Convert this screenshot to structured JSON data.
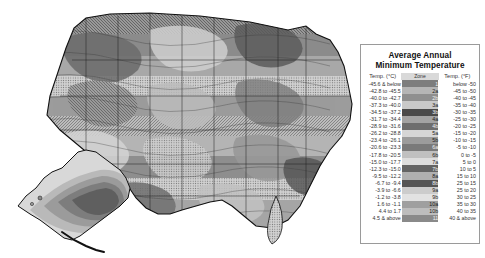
{
  "page": {
    "background_color": "#ffffff"
  },
  "map": {
    "name": "united-states-hardiness-zone-map",
    "insets": [
      "alaska-inset"
    ],
    "style": "grayscale-shaded-contour"
  },
  "legend": {
    "title_line1": "Average Annual",
    "title_line2": "Minimum Temperature",
    "headers": {
      "celsius": "Temp. (°C)",
      "zone": "Zone",
      "fahrenheit": "Temp. (°F)"
    },
    "rows": [
      {
        "celsius": "-45.6 & below",
        "zone": "1",
        "fahrenheit": "below -50",
        "swatch": "#7d7d7d",
        "text": "light"
      },
      {
        "celsius": "-42.8 to -45.5",
        "zone": "2a",
        "fahrenheit": "-45 to -50",
        "swatch": "#b5b5b5",
        "text": "dark"
      },
      {
        "celsius": "-40.0 to -42.7",
        "zone": "2b",
        "fahrenheit": "-40 to -45",
        "swatch": "#8f8f8f",
        "text": "light"
      },
      {
        "celsius": "-37.3 to -40.0",
        "zone": "3a",
        "fahrenheit": "-35 to -40",
        "swatch": "#c9c9c9",
        "text": "dark"
      },
      {
        "celsius": "-34.5 to -37.2",
        "zone": "3b",
        "fahrenheit": "-30 to -35",
        "swatch": "#4a4a4a",
        "text": "light"
      },
      {
        "celsius": "-31.7 to -34.4",
        "zone": "4a",
        "fahrenheit": "-25 to -30",
        "swatch": "#a3a3a3",
        "text": "dark"
      },
      {
        "celsius": "-28.9 to -31.6",
        "zone": "4b",
        "fahrenheit": "-20 to -25",
        "swatch": "#6e6e6e",
        "text": "light"
      },
      {
        "celsius": "-26.2 to -28.8",
        "zone": "5a",
        "fahrenheit": "-15 to -20",
        "swatch": "#d6d6d6",
        "text": "dark"
      },
      {
        "celsius": "-23.4 to -26.1",
        "zone": "5b",
        "fahrenheit": "-10 to -15",
        "swatch": "#9c9c9c",
        "text": "dark"
      },
      {
        "celsius": "-20.6 to -23.3",
        "zone": "6a",
        "fahrenheit": "-5 to -10",
        "swatch": "#7a7a7a",
        "text": "light"
      },
      {
        "celsius": "-17.8 to -20.5",
        "zone": "6b",
        "fahrenheit": "0 to -5",
        "swatch": "#c0c0c0",
        "text": "dark"
      },
      {
        "celsius": "-15.0 to -17.7",
        "zone": "7a",
        "fahrenheit": "5 to 0",
        "swatch": "#dddddd",
        "text": "dark"
      },
      {
        "celsius": "-12.3 to -15.0",
        "zone": "7b",
        "fahrenheit": "10 to 5",
        "swatch": "#646464",
        "text": "light"
      },
      {
        "celsius": "-9.5 to -12.2",
        "zone": "8a",
        "fahrenheit": "15 to 10",
        "swatch": "#b0b0b0",
        "text": "dark"
      },
      {
        "celsius": "-6.7 to -9.4",
        "zone": "8b",
        "fahrenheit": "25 to 15",
        "swatch": "#555555",
        "text": "light"
      },
      {
        "celsius": "-3.9 to -6.6",
        "zone": "9a",
        "fahrenheit": "25 to 20",
        "swatch": "#cccccc",
        "text": "dark"
      },
      {
        "celsius": "-1.2 to -3.8",
        "zone": "9b",
        "fahrenheit": "30 to 25",
        "swatch": "#e2e2e2",
        "text": "dark"
      },
      {
        "celsius": "1.6 to -1.1",
        "zone": "10a",
        "fahrenheit": "35 to 30",
        "swatch": "#9f9f9f",
        "text": "dark"
      },
      {
        "celsius": "4.4 to 1.7",
        "zone": "10b",
        "fahrenheit": "40 to 35",
        "swatch": "#bdbdbd",
        "text": "dark"
      },
      {
        "celsius": "4.5 & above",
        "zone": "11",
        "fahrenheit": "40 & above",
        "swatch": "#8a8a8a",
        "text": "light"
      }
    ]
  }
}
